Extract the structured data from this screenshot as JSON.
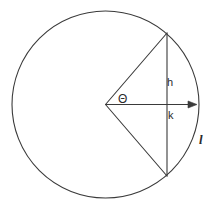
{
  "diagram": {
    "background_color": "#ffffff",
    "stroke_color": "#3a3a3a",
    "text_color": "#2b2b2b",
    "stroke_width": 1.1,
    "circle": {
      "center_x": 105.5,
      "center_y": 104.5,
      "radius": 93.5
    },
    "sector": {
      "apex_x": 105.5,
      "apex_y": 104.5,
      "top_vertex_x": 167,
      "top_vertex_y": 33,
      "bottom_vertex_x": 167,
      "bottom_vertex_y": 176
    },
    "chord": {
      "x": 167,
      "y_top": 33,
      "y_bottom": 176
    },
    "arrow": {
      "x_start": 105.5,
      "y": 104.5,
      "x_end": 197,
      "head_length": 8,
      "head_width": 7
    },
    "labels": {
      "angle": "Θ",
      "height": "h",
      "apothem": "k",
      "arc": "l"
    }
  }
}
